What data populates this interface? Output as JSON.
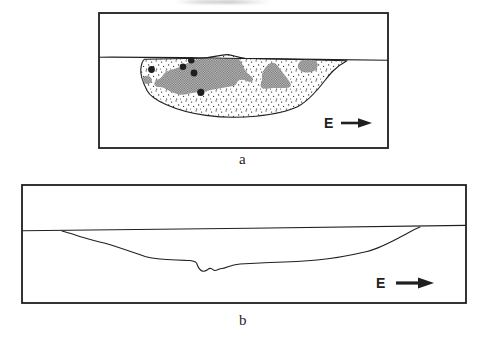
{
  "figure": {
    "background": "#ffffff",
    "ink_color": "#1f1f1f",
    "gray_dark": "#6e6e6e",
    "gray_light": "#c6c6c6",
    "stipple_color": "#2b2b2b",
    "panels": [
      {
        "label": "a",
        "direction_label": "E"
      },
      {
        "label": "b",
        "direction_label": "E"
      }
    ]
  }
}
